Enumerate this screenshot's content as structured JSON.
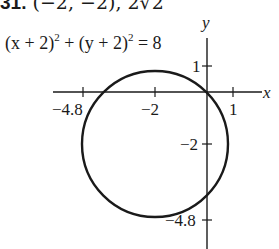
{
  "problem": {
    "number": "31.",
    "given": "(−2, −2), 2√2",
    "equation": {
      "lhs_a": "(x + 2)",
      "exp_a": "2",
      "plus": " + ",
      "lhs_b": "(y + 2)",
      "exp_b": "2",
      "rhs": " = 8"
    }
  },
  "graph": {
    "x_axis_label": "x",
    "y_axis_label": "y",
    "x_ticks": [
      {
        "value": -4.8,
        "label": "−4.8"
      },
      {
        "value": -2,
        "label": "−2"
      },
      {
        "value": 1,
        "label": "1"
      }
    ],
    "y_ticks": [
      {
        "value": 1,
        "label": "1"
      },
      {
        "value": -2,
        "label": "−2"
      },
      {
        "value": -4.8,
        "label": "−4.8"
      }
    ],
    "circle": {
      "center": [
        -2,
        -2
      ],
      "radius": "2√2"
    },
    "stroke_color": "#1a1a1a"
  }
}
